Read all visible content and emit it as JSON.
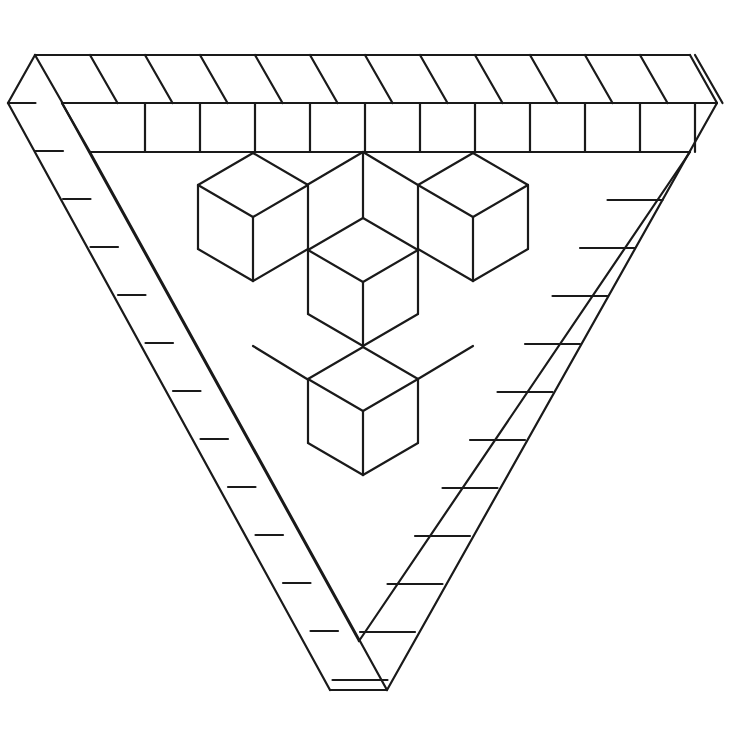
{
  "figure": {
    "stroke_color": "#1a1a1a",
    "background": "#ffffff",
    "stroke_width": 2.2
  },
  "geometry": {
    "band_origin": [
      35,
      55
    ],
    "band_unit_a": [
      55,
      0
    ],
    "band_unit_b": [
      27.5,
      48
    ],
    "band_rows": 13
  }
}
